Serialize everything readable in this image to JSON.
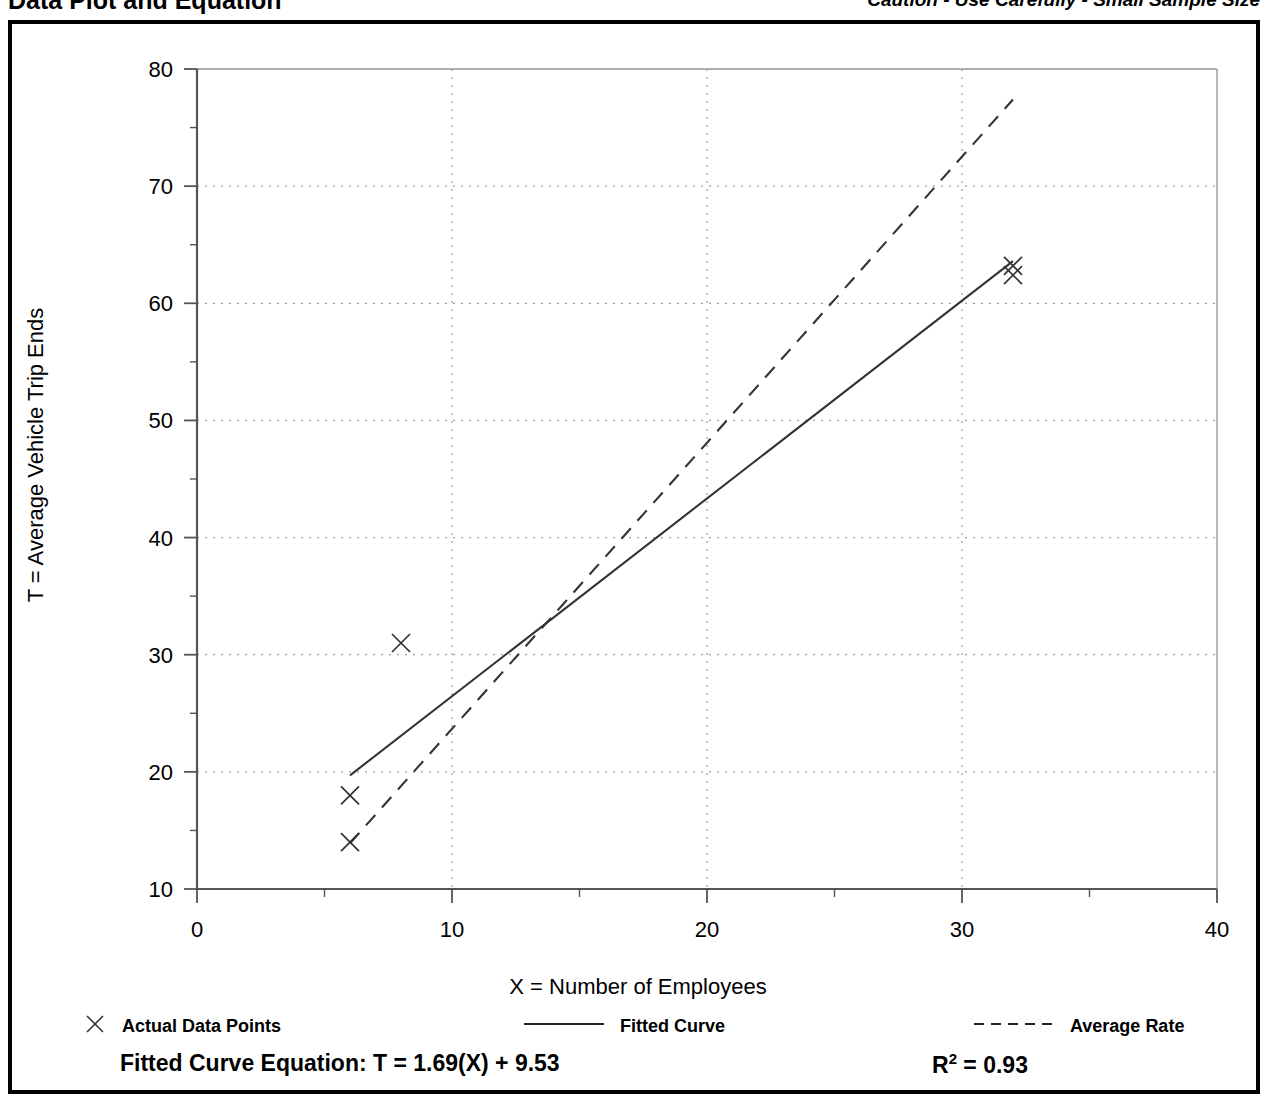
{
  "header": {
    "title": "Data Plot and Equation",
    "caution": "Caution - Use Carefully - Small Sample Size"
  },
  "legend": {
    "points_label": "Actual Data Points",
    "fitted_label": "Fitted Curve",
    "average_label": "Average Rate"
  },
  "equation": {
    "fitted_text": "Fitted Curve Equation:  T = 1.69(X) + 9.53",
    "r_squared_prefix": "R",
    "r_squared_sup": "2",
    "r_squared_value": " = 0.93"
  },
  "chart_data": {
    "type": "scatter",
    "title": "Data Plot and Equation",
    "xlabel": "X = Number of Employees",
    "ylabel": "T = Average Vehicle Trip Ends",
    "xlim": [
      0,
      40
    ],
    "ylim": [
      10,
      80
    ],
    "xticks": [
      0,
      10,
      20,
      30,
      40
    ],
    "yticks": [
      10,
      20,
      30,
      40,
      50,
      60,
      70,
      80
    ],
    "xtick_labels": [
      "0",
      "10",
      "20",
      "30",
      "40"
    ],
    "ytick_labels": [
      "10",
      "20",
      "30",
      "40",
      "50",
      "60",
      "70",
      "80"
    ],
    "xminor_interval": 5,
    "yminor_interval": 5,
    "grid": true,
    "grid_style": "dotted",
    "grid_color": "#9a9a9a",
    "axis_color": "#555555",
    "series": [
      {
        "name": "Actual Data Points",
        "type": "scatter",
        "marker": "x",
        "color": "#333333",
        "points": [
          {
            "x": 6,
            "y": 14
          },
          {
            "x": 6,
            "y": 18
          },
          {
            "x": 8,
            "y": 31
          },
          {
            "x": 32,
            "y": 62.4
          },
          {
            "x": 32,
            "y": 63.2
          }
        ]
      },
      {
        "name": "Fitted Curve",
        "type": "line",
        "style": "solid",
        "color": "#333333",
        "equation": "T = 1.69(X) + 9.53",
        "slope": 1.69,
        "intercept": 9.53,
        "r_squared": 0.93,
        "x_range": [
          6,
          32
        ],
        "endpoints": [
          {
            "x": 6,
            "y": 19.7
          },
          {
            "x": 32,
            "y": 63.6
          }
        ]
      },
      {
        "name": "Average Rate",
        "type": "line",
        "style": "dashed",
        "color": "#333333",
        "endpoints": [
          {
            "x": 6,
            "y": 13.9
          },
          {
            "x": 32,
            "y": 77.4
          }
        ]
      }
    ]
  }
}
